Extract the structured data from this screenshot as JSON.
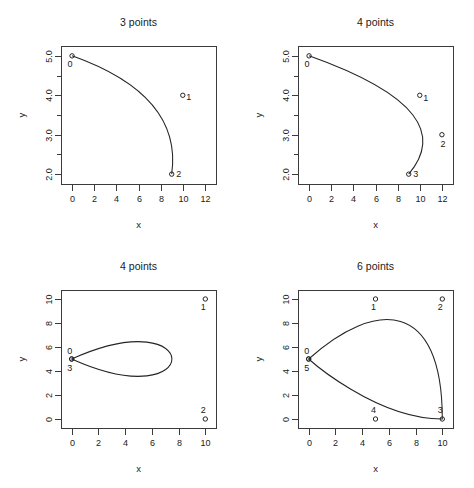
{
  "figure": {
    "layout": "2x2 grid of Bezier curve panels",
    "background_color": "#ffffff",
    "curve_color": "#242424",
    "axis_color": "#3b3b3b"
  },
  "chart_data": [
    {
      "type": "line",
      "title": "3 points",
      "xlabel": "x",
      "ylabel": "y",
      "xlim": [
        -1.0,
        13.0
      ],
      "ylim": [
        1.75,
        5.25
      ],
      "xticks": [
        0,
        2,
        4,
        6,
        8,
        10,
        12
      ],
      "xticklabels": [
        "0",
        "2",
        "4",
        "6",
        "8",
        "10",
        "12"
      ],
      "yticks": [
        2.0,
        3.0,
        4.0,
        5.0
      ],
      "yticklabels": [
        "2.0",
        "3.0",
        "4.0",
        "5.0"
      ],
      "yminorticks": [
        2.5,
        3.5,
        4.5
      ],
      "grid": false,
      "legend": "none",
      "curve_kind": "quadratic-bezier",
      "control_points": [
        {
          "label": "0",
          "x": 0,
          "y": 5,
          "label_dx": -2,
          "label_dy": 11
        },
        {
          "label": "1",
          "x": 10,
          "y": 4,
          "label_dx": 6,
          "label_dy": 5
        },
        {
          "label": "2",
          "x": 9,
          "y": 2,
          "label_dx": 7,
          "label_dy": 3
        }
      ]
    },
    {
      "type": "line",
      "title": "4 points",
      "xlabel": "x",
      "ylabel": "y",
      "xlim": [
        -1.0,
        13.0
      ],
      "ylim": [
        1.75,
        5.25
      ],
      "xticks": [
        0,
        2,
        4,
        6,
        8,
        10,
        12
      ],
      "xticklabels": [
        "0",
        "2",
        "4",
        "6",
        "8",
        "10",
        "12"
      ],
      "yticks": [
        2.0,
        3.0,
        4.0,
        5.0
      ],
      "yticklabels": [
        "2.0",
        "3.0",
        "4.0",
        "5.0"
      ],
      "yminorticks": [
        2.5,
        3.5,
        4.5
      ],
      "grid": false,
      "legend": "none",
      "curve_kind": "cubic-bezier",
      "control_points": [
        {
          "label": "0",
          "x": 0,
          "y": 5,
          "label_dx": -2,
          "label_dy": 11
        },
        {
          "label": "1",
          "x": 10,
          "y": 4,
          "label_dx": 6,
          "label_dy": 6
        },
        {
          "label": "2",
          "x": 12,
          "y": 3,
          "label_dx": 1,
          "label_dy": 12
        },
        {
          "label": "3",
          "x": 9,
          "y": 2,
          "label_dx": 7,
          "label_dy": 3
        }
      ]
    },
    {
      "type": "line",
      "title": "4 points",
      "xlabel": "x",
      "ylabel": "y",
      "xlim": [
        -0.8,
        10.8
      ],
      "ylim": [
        -0.75,
        10.75
      ],
      "xticks": [
        0,
        2,
        4,
        6,
        8,
        10
      ],
      "xticklabels": [
        "0",
        "2",
        "4",
        "6",
        "8",
        "10"
      ],
      "yticks": [
        0,
        2,
        4,
        6,
        8,
        10
      ],
      "yticklabels": [
        "0",
        "2",
        "4",
        "6",
        "8",
        "10"
      ],
      "yminorticks": [],
      "grid": false,
      "legend": "none",
      "curve_kind": "closed-cubic-bezier",
      "control_points": [
        {
          "label": "0",
          "x": 0,
          "y": 5,
          "label_dx": -2,
          "label_dy": -5
        },
        {
          "label": "1",
          "x": 10,
          "y": 10,
          "label_dx": -2,
          "label_dy": 11
        },
        {
          "label": "2",
          "x": 10,
          "y": 0,
          "label_dx": -2,
          "label_dy": -6
        },
        {
          "label": "3",
          "x": 0,
          "y": 5,
          "label_dx": -2,
          "label_dy": 12
        }
      ]
    },
    {
      "type": "line",
      "title": "6 points",
      "xlabel": "x",
      "ylabel": "y",
      "xlim": [
        -0.8,
        10.8
      ],
      "ylim": [
        -0.75,
        10.75
      ],
      "xticks": [
        0,
        2,
        4,
        6,
        8,
        10
      ],
      "xticklabels": [
        "0",
        "2",
        "4",
        "6",
        "8",
        "10"
      ],
      "yticks": [
        0,
        2,
        4,
        6,
        8,
        10
      ],
      "yticklabels": [
        "0",
        "2",
        "4",
        "6",
        "8",
        "10"
      ],
      "yminorticks": [],
      "grid": false,
      "legend": "none",
      "curve_kind": "closed-cubic-bezier",
      "control_points": [
        {
          "label": "0",
          "x": 0,
          "y": 5,
          "label_dx": -2,
          "label_dy": -5
        },
        {
          "label": "1",
          "x": 5,
          "y": 10,
          "label_dx": -2,
          "label_dy": 11
        },
        {
          "label": "2",
          "x": 10,
          "y": 10,
          "label_dx": -2,
          "label_dy": 11
        },
        {
          "label": "3",
          "x": 10,
          "y": 0,
          "label_dx": -2,
          "label_dy": -6
        },
        {
          "label": "4",
          "x": 5,
          "y": 0,
          "label_dx": -2,
          "label_dy": -6
        },
        {
          "label": "5",
          "x": 0,
          "y": 5,
          "label_dx": -2,
          "label_dy": 12
        }
      ]
    }
  ]
}
